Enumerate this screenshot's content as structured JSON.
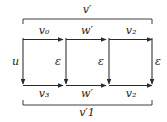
{
  "diagram": {
    "type": "commutative-diagram",
    "stroke_color": "#2b2b2b",
    "text_color": "#1b1b1b",
    "background_color": "#ffffff",
    "brackets": {
      "top": {
        "label": "v",
        "prime": "′",
        "subscript": "",
        "full_label": "v′",
        "tick_direction": "down"
      },
      "bottom": {
        "label": "v",
        "prime": "′",
        "subscript": "1",
        "full_label": "v′1",
        "tick_direction": "up"
      }
    },
    "top_row_arrows": [
      {
        "name": "v0",
        "base": "v",
        "prime": "",
        "subscript": "0",
        "full_label": "v₀",
        "direction": "right"
      },
      {
        "name": "w-prime",
        "base": "w",
        "prime": "′",
        "subscript": "",
        "full_label": "w′",
        "direction": "right"
      },
      {
        "name": "v2",
        "base": "v",
        "prime": "",
        "subscript": "2",
        "full_label": "v₂",
        "direction": "right"
      }
    ],
    "bottom_row_arrows": [
      {
        "name": "v3",
        "base": "v",
        "prime": "",
        "subscript": "3",
        "full_label": "v₃",
        "direction": "right"
      },
      {
        "name": "w-prime",
        "base": "w",
        "prime": "′",
        "subscript": "",
        "full_label": "w′",
        "direction": "right"
      },
      {
        "name": "v2",
        "base": "v",
        "prime": "",
        "subscript": "2",
        "full_label": "v₂",
        "direction": "right"
      }
    ],
    "vertical_arrows": [
      {
        "name": "u",
        "full_label": "u",
        "direction": "down"
      },
      {
        "name": "epsilon-1",
        "full_label": "ε",
        "direction": "down"
      },
      {
        "name": "epsilon-2",
        "full_label": "ε",
        "direction": "down"
      },
      {
        "name": "epsilon-3",
        "full_label": "ε",
        "direction": "down"
      }
    ]
  }
}
